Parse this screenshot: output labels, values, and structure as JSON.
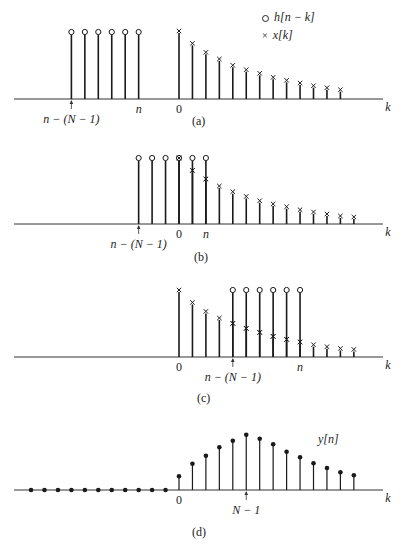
{
  "figure": {
    "legend": {
      "circle_label": "h[n − k]",
      "cross_label": "x[k]"
    },
    "axis_label": "k",
    "style": {
      "stem_color": "#1a1a1a",
      "axis_color": "#333333"
    },
    "geometry": {
      "k0_x": 179,
      "dk": 13.45,
      "axis_x1": 14,
      "axis_x2": 383
    }
  },
  "chart_data": [
    {
      "type": "stem",
      "panel": "(a)",
      "axis_y": 99,
      "circles": {
        "label": "h[n − k]",
        "k": [
          -8,
          -7,
          -6,
          -5,
          -4,
          -3
        ],
        "height": 67
      },
      "crosses": {
        "label": "x[k]",
        "k": [
          0,
          1,
          2,
          3,
          4,
          5,
          6,
          7,
          8,
          9,
          10,
          11,
          12
        ],
        "heights": [
          68,
          55.7,
          46.7,
          40,
          33.7,
          29.3,
          25.7,
          21.7,
          18.7,
          16,
          13.3,
          11.3,
          9.3
        ]
      },
      "tick_labels": [
        {
          "text": "n",
          "k": -3,
          "italic": true
        },
        {
          "text": "0",
          "k": 0,
          "italic": false
        }
      ],
      "arrow": {
        "k": -8,
        "text": "n − (N − 1)"
      },
      "caption": "(a)"
    },
    {
      "type": "stem",
      "panel": "(b)",
      "axis_y": 224,
      "circles": {
        "label": "h[n − k]",
        "k": [
          -3,
          -2,
          -1,
          0,
          1,
          2
        ],
        "height": 66
      },
      "crosses": {
        "label": "x[k]",
        "k": [
          0,
          1,
          2,
          3,
          4,
          5,
          6,
          7,
          8,
          9,
          10,
          11,
          12,
          13
        ],
        "heights": [
          66,
          53.6,
          45,
          38,
          32.3,
          27.6,
          23.3,
          20,
          17.3,
          14.3,
          12,
          10,
          8,
          7
        ]
      },
      "tick_labels": [
        {
          "text": "0",
          "k": 0,
          "italic": false
        },
        {
          "text": "n",
          "k": 2,
          "italic": true
        }
      ],
      "arrow": {
        "k": -3,
        "text": "n − (N − 1)"
      },
      "caption": "(b)"
    },
    {
      "type": "stem",
      "panel": "(c)",
      "axis_y": 357,
      "circles": {
        "label": "h[n − k]",
        "k": [
          4,
          5,
          6,
          7,
          8,
          9
        ],
        "height": 67
      },
      "crosses": {
        "label": "x[k]",
        "k": [
          0,
          1,
          2,
          3,
          4,
          5,
          6,
          7,
          8,
          9,
          10,
          11,
          12,
          13
        ],
        "heights": [
          67,
          54.6,
          45.6,
          39,
          33.6,
          28.6,
          24.6,
          20.6,
          17.6,
          15,
          12.3,
          10.3,
          8.6,
          7.6
        ]
      },
      "tick_labels": [
        {
          "text": "0",
          "k": 0,
          "italic": false
        },
        {
          "text": "n",
          "k": 9,
          "italic": true
        }
      ],
      "arrow": {
        "k": 4,
        "text": "n − (N − 1)"
      },
      "caption": "(c)"
    },
    {
      "type": "stem",
      "panel": "(d)",
      "axis_y": 490,
      "series_label": "y[n]",
      "zero_dots_k": [
        -11,
        -10,
        -9,
        -8,
        -7,
        -6,
        -5,
        -4,
        -3,
        -2,
        -1
      ],
      "dots": {
        "k": [
          0,
          1,
          2,
          3,
          4,
          5,
          6,
          7,
          8,
          9,
          10,
          11,
          12,
          13
        ],
        "heights": [
          13.7,
          26.3,
          34.3,
          42.7,
          49.3,
          55.3,
          51.3,
          45.7,
          38.3,
          32.7,
          26.7,
          22,
          17.7,
          14.7
        ]
      },
      "tick_labels": [
        {
          "text": "0",
          "k": 0,
          "italic": false
        }
      ],
      "arrow": {
        "k": 5,
        "text": "N − 1"
      },
      "caption": "(d)"
    }
  ]
}
